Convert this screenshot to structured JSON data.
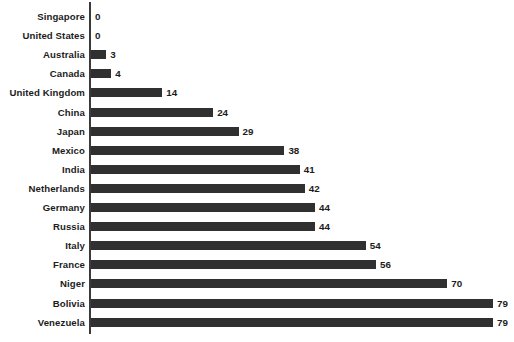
{
  "chart": {
    "title": "",
    "subtitle": "",
    "xlabel": "",
    "ylabel": ""
  },
  "chart_data": {
    "type": "bar",
    "orientation": "horizontal",
    "title": "",
    "subtitle": "",
    "xlabel": "",
    "ylabel": "",
    "xlim": [
      0,
      79
    ],
    "ylim": null,
    "grid": false,
    "legend": null,
    "legend_position": "none",
    "data_labels": true,
    "bar_color": "#303030",
    "axis_color": "#3a3a3a",
    "text_color": "#1c1c1c",
    "categories": [
      "Singapore",
      "United States",
      "Australia",
      "Canada",
      "United Kingdom",
      "China",
      "Japan",
      "Mexico",
      "India",
      "Netherlands",
      "Germany",
      "Russia",
      "Italy",
      "France",
      "Niger",
      "Bolivia",
      "Venezuela"
    ],
    "values": [
      0,
      0,
      3,
      4,
      14,
      24,
      29,
      38,
      41,
      42,
      44,
      44,
      54,
      56,
      70,
      79,
      79
    ],
    "value_labels": [
      "0",
      "0",
      "3",
      "4",
      "14",
      "24",
      "29",
      "38",
      "41",
      "42",
      "44",
      "44",
      "54",
      "56",
      "70",
      "79",
      "79"
    ],
    "rows": [
      {
        "category": "Singapore",
        "value": 0,
        "label": "0"
      },
      {
        "category": "United States",
        "value": 0,
        "label": "0"
      },
      {
        "category": "Australia",
        "value": 3,
        "label": "3"
      },
      {
        "category": "Canada",
        "value": 4,
        "label": "4"
      },
      {
        "category": "United Kingdom",
        "value": 14,
        "label": "14"
      },
      {
        "category": "China",
        "value": 24,
        "label": "24"
      },
      {
        "category": "Japan",
        "value": 29,
        "label": "29"
      },
      {
        "category": "Mexico",
        "value": 38,
        "label": "38"
      },
      {
        "category": "India",
        "value": 41,
        "label": "41"
      },
      {
        "category": "Netherlands",
        "value": 42,
        "label": "42"
      },
      {
        "category": "Germany",
        "value": 44,
        "label": "44"
      },
      {
        "category": "Russia",
        "value": 44,
        "label": "44"
      },
      {
        "category": "Italy",
        "value": 54,
        "label": "54"
      },
      {
        "category": "France",
        "value": 56,
        "label": "56"
      },
      {
        "category": "Niger",
        "value": 70,
        "label": "70"
      },
      {
        "category": "Bolivia",
        "value": 79,
        "label": "79"
      },
      {
        "category": "Venezuela",
        "value": 79,
        "label": "79"
      }
    ]
  },
  "layout": {
    "px_per_unit": 5.09,
    "row_pitch": 19.1,
    "first_row_top": 7,
    "bar_origin_x": 91,
    "value_gap": 4
  }
}
